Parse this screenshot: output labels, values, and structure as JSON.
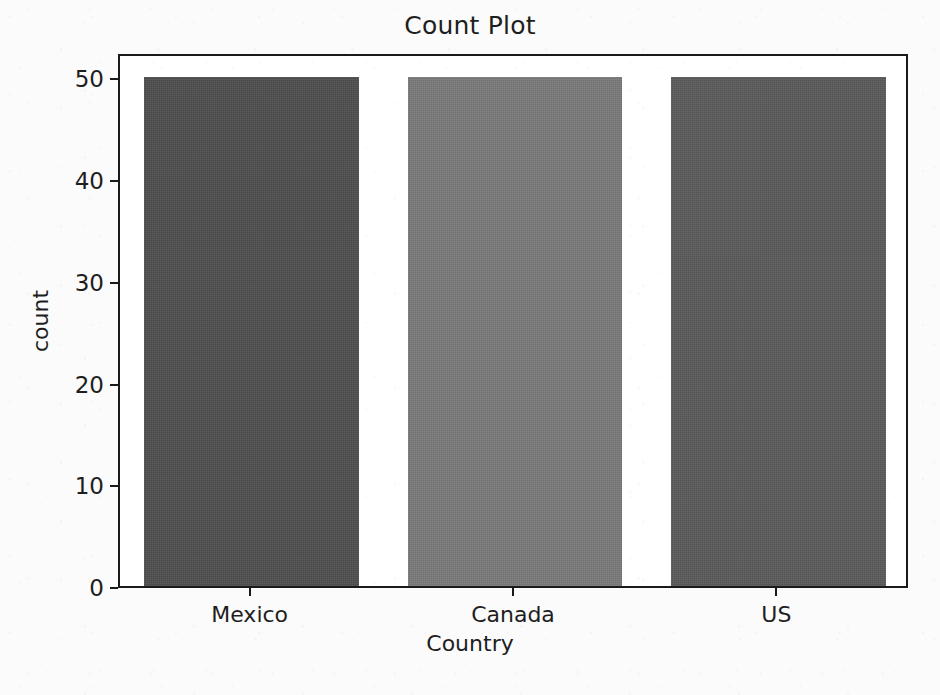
{
  "figure": {
    "background_color": "#fbfbfb",
    "plot_background_color": "#ffffff",
    "axes_color": "#1a1a1a",
    "text_color": "#1e1e1e"
  },
  "chart_data": {
    "type": "bar",
    "title": "Count Plot",
    "xlabel": "Country",
    "ylabel": "count",
    "categories": [
      "Mexico",
      "Canada",
      "US"
    ],
    "values": [
      50,
      50,
      50
    ],
    "series": [
      {
        "name": "count",
        "values": [
          50,
          50,
          50
        ]
      }
    ],
    "bar_colors": [
      "#4e4e4e",
      "#7a7a7a",
      "#5a5a5a"
    ],
    "ylim": [
      0,
      52.5
    ],
    "yticks": [
      0,
      10,
      20,
      30,
      40,
      50
    ],
    "ytick_labels": [
      "0",
      "10",
      "20",
      "30",
      "40",
      "50"
    ],
    "xtick_labels": [
      "Mexico",
      "Canada",
      "US"
    ],
    "grid": false,
    "legend": null,
    "legend_position": "none"
  }
}
